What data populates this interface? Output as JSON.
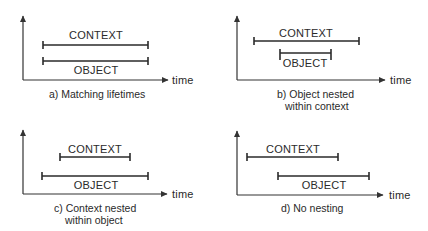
{
  "figure": {
    "axis_label": "time",
    "panels": [
      {
        "id": "a",
        "caption_lines": [
          "a)  Matching lifetimes"
        ],
        "context": {
          "label": "CONTEXT",
          "start": 0,
          "end": 105
        },
        "object": {
          "label": "OBJECT",
          "start": 0,
          "end": 105
        }
      },
      {
        "id": "b",
        "caption_lines": [
          "b)  Object nested",
          "within context"
        ],
        "context": {
          "label": "CONTEXT",
          "start": 0,
          "end": 105
        },
        "object": {
          "label": "OBJECT",
          "start": 26,
          "end": 77
        }
      },
      {
        "id": "c",
        "caption_lines": [
          "c)  Context nested",
          "within object"
        ],
        "context": {
          "label": "CONTEXT",
          "start": 18,
          "end": 88
        },
        "object": {
          "label": "OBJECT",
          "start": 0,
          "end": 106
        }
      },
      {
        "id": "d",
        "caption_lines": [
          "d)  No nesting"
        ],
        "context": {
          "label": "CONTEXT",
          "start": 0,
          "end": 91
        },
        "object": {
          "label": "OBJECT",
          "start": 31,
          "end": 122
        }
      }
    ]
  }
}
